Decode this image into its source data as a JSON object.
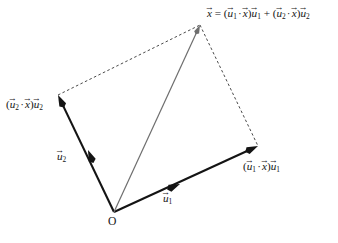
{
  "figure": {
    "background_color": "#ffffff",
    "width": 338,
    "height": 243,
    "origin_label": "O",
    "colors": {
      "solid_vector": "#141414",
      "resultant_vector": "#6e6e6e",
      "dashed_guide": "#4a4a4a"
    },
    "labels": {
      "x_equation": {
        "parts": [
          "x",
          "=",
          "(",
          "u",
          "1",
          "·",
          "x",
          ")",
          "u",
          "1",
          "+",
          "(",
          "u",
          "2",
          "·",
          "x",
          ")",
          "u",
          "2"
        ],
        "plain": "x⃗ = (u⃗₁ · x⃗)u⃗₁ + (u⃗₂ · x⃗)u⃗₂"
      },
      "proj_u1": {
        "plain": "(u⃗₁ · x⃗)u⃗₁"
      },
      "proj_u2": {
        "plain": "(u⃗₂ · x⃗)u⃗₂"
      },
      "u1": {
        "plain": "u⃗₁"
      },
      "u2": {
        "plain": "u⃗₂"
      }
    },
    "glyphs": {
      "vector_arrow": "→",
      "dot_operator": "·",
      "equals": "=",
      "plus": "+",
      "paren_open": "(",
      "paren_close": ")",
      "sub_one": "1",
      "sub_two": "2",
      "var_u": "u",
      "var_x": "x"
    }
  },
  "chart_data": {
    "type": "diagram",
    "points": {
      "O": [
        114,
        212
      ],
      "u1_tip": [
        180,
        184
      ],
      "u2_tip": [
        88,
        150
      ],
      "proj_u1_tip": [
        258,
        146
      ],
      "proj_u2_tip": [
        58,
        95
      ],
      "x_tip": [
        200,
        25
      ]
    },
    "vectors": [
      {
        "name": "proj_u1",
        "label": "(u⃗₁ · x⃗)u⃗₁",
        "from": [
          114,
          212
        ],
        "to": [
          258,
          146
        ],
        "style": "solid",
        "color": "#141414",
        "width": 2.1
      },
      {
        "name": "proj_u2",
        "label": "(u⃗₂ · x⃗)u⃗₂",
        "from": [
          114,
          212
        ],
        "to": [
          58,
          95
        ],
        "style": "solid",
        "color": "#141414",
        "width": 2.1
      },
      {
        "name": "x",
        "label": "x⃗",
        "from": [
          114,
          212
        ],
        "to": [
          200,
          25
        ],
        "style": "solid",
        "color": "#6e6e6e",
        "width": 1.2
      },
      {
        "name": "u1",
        "label": "u⃗₁",
        "from": [
          114,
          212
        ],
        "to": [
          180,
          184
        ],
        "style": "arrowhead-only",
        "color": "#141414",
        "width": 2.1
      },
      {
        "name": "u2",
        "label": "u⃗₂",
        "from": [
          114,
          212
        ],
        "to": [
          88,
          150
        ],
        "style": "arrowhead-only",
        "color": "#141414",
        "width": 2.1
      }
    ],
    "guides": [
      {
        "name": "dashed-top-left",
        "from": [
          58,
          95
        ],
        "to": [
          200,
          25
        ],
        "style": "dashed",
        "color": "#4a4a4a"
      },
      {
        "name": "dashed-right",
        "from": [
          200,
          25
        ],
        "to": [
          258,
          146
        ],
        "style": "dashed",
        "color": "#4a4a4a"
      }
    ]
  }
}
